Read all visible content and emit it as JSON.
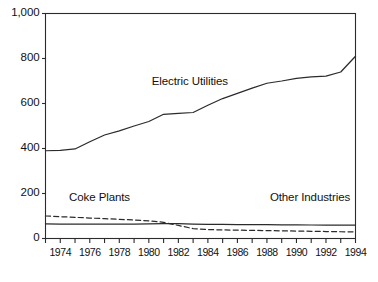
{
  "chart_data": {
    "type": "line",
    "title": "",
    "subtitle": "",
    "xlabel": "",
    "ylabel": "",
    "xlim": [
      1973,
      1994
    ],
    "ylim": [
      0,
      1000
    ],
    "grid": false,
    "legend_position": "inline-annotations",
    "y_ticks": [
      0,
      200,
      400,
      600,
      800,
      1000
    ],
    "y_tick_labels": [
      "0",
      "200",
      "400",
      "600",
      "800",
      "1,000"
    ],
    "x_ticks": [
      1974,
      1976,
      1978,
      1980,
      1982,
      1984,
      1986,
      1988,
      1990,
      1992,
      1994
    ],
    "x_tick_labels": [
      "1974",
      "1976",
      "1978",
      "1980",
      "1982",
      "1984",
      "1986",
      "1988",
      "1990",
      "1992",
      "1994"
    ],
    "x_minor_ticks": [
      1973,
      1975,
      1977,
      1979,
      1981,
      1983,
      1985,
      1987,
      1989,
      1991,
      1993
    ],
    "x": [
      1973,
      1974,
      1975,
      1976,
      1977,
      1978,
      1979,
      1980,
      1981,
      1982,
      1983,
      1984,
      1985,
      1986,
      1987,
      1988,
      1989,
      1990,
      1991,
      1992,
      1993,
      1994
    ],
    "series": [
      {
        "name": "Electric Utilities",
        "style": "solid",
        "color": "#2b2b2b",
        "values": [
          390,
          392,
          398,
          430,
          460,
          478,
          500,
          520,
          552,
          556,
          560,
          592,
          622,
          645,
          668,
          690,
          700,
          712,
          718,
          722,
          740,
          810
        ]
      },
      {
        "name": "Coke Plants",
        "style": "dashed",
        "color": "#2b2b2b",
        "values": [
          100,
          97,
          94,
          91,
          88,
          85,
          82,
          78,
          72,
          58,
          44,
          40,
          38,
          37,
          36,
          35,
          34,
          33,
          32,
          31,
          30,
          30
        ]
      },
      {
        "name": "Other Industries",
        "style": "solid",
        "color": "#2b2b2b",
        "values": [
          65,
          64,
          64,
          64,
          64,
          64,
          64,
          65,
          66,
          66,
          64,
          63,
          63,
          62,
          62,
          62,
          61,
          61,
          60,
          60,
          60,
          60
        ]
      }
    ],
    "annotations": [
      {
        "text": "Electric Utilities",
        "x": 1980.2,
        "y": 690
      },
      {
        "text": "Coke Plants",
        "x": 1974.6,
        "y": 175
      },
      {
        "text": "Other Industries",
        "x": 1988.2,
        "y": 175
      }
    ]
  }
}
